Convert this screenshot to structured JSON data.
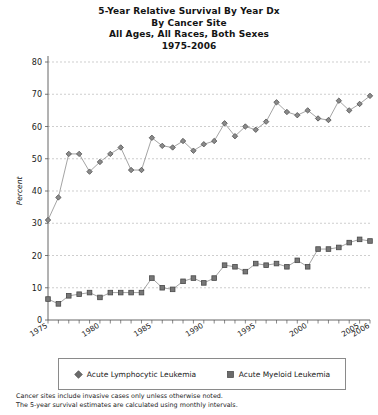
{
  "title": {
    "lines": [
      "5-Year Relative Survival By Year Dx",
      "By Cancer Site",
      "All Ages, All Races, Both Sexes",
      "1975-2006"
    ]
  },
  "legend": {
    "items": [
      {
        "label": "Acute Lymphocytic Leukemia",
        "marker": "diamond",
        "color": "#6b6b6b"
      },
      {
        "label": "Acute Myeloid Leukemia",
        "marker": "square",
        "color": "#6b6b6b"
      }
    ]
  },
  "footnotes": [
    "Cancer sites include invasive cases only unless otherwise noted.",
    "The 5-year survival estimates are calculated using monthly intervals."
  ],
  "chart_data": {
    "type": "line",
    "title": "5-Year Relative Survival By Year Dx",
    "xlabel": "Year of diagnosis",
    "ylabel": "Percent",
    "xlim": [
      1975,
      2006
    ],
    "ylim": [
      0,
      80
    ],
    "ytick_step": 10,
    "yticks": [
      0,
      10,
      20,
      30,
      40,
      50,
      60,
      70,
      80
    ],
    "xticks_labeled": [
      1975,
      1980,
      1985,
      1990,
      1995,
      2000,
      2005,
      2006
    ],
    "grid": "horizontal-dashed",
    "legend_position": "below",
    "x": [
      1975,
      1976,
      1977,
      1978,
      1979,
      1980,
      1981,
      1982,
      1983,
      1984,
      1985,
      1986,
      1987,
      1988,
      1989,
      1990,
      1991,
      1992,
      1993,
      1994,
      1995,
      1996,
      1997,
      1998,
      1999,
      2000,
      2001,
      2002,
      2003,
      2004,
      2005,
      2006
    ],
    "series": [
      {
        "name": "Acute Lymphocytic Leukemia",
        "marker": "diamond",
        "color": "#6b6b6b",
        "values": [
          31.0,
          38.0,
          51.5,
          51.5,
          46.0,
          49.0,
          51.5,
          53.5,
          46.5,
          46.5,
          56.5,
          54.0,
          53.5,
          55.5,
          52.5,
          54.5,
          55.5,
          61.0,
          57.0,
          60.0,
          59.0,
          61.5,
          67.5,
          64.5,
          63.5,
          65.0,
          62.5,
          62.0,
          68.0,
          65.0,
          67.0,
          69.5
        ]
      },
      {
        "name": "Acute Myeloid Leukemia",
        "marker": "square",
        "color": "#6b6b6b",
        "values": [
          6.5,
          5.0,
          7.5,
          8.0,
          8.5,
          7.0,
          8.5,
          8.5,
          8.5,
          8.5,
          13.0,
          10.0,
          9.5,
          12.0,
          13.0,
          11.5,
          13.0,
          17.0,
          16.5,
          15.0,
          17.5,
          17.0,
          17.5,
          16.5,
          18.5,
          16.5,
          22.0,
          22.0,
          22.5,
          24.0,
          25.0,
          24.5
        ]
      }
    ]
  }
}
